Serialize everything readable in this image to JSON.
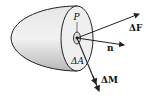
{
  "diagram": {
    "type": "free-body section",
    "labels": {
      "point": "P",
      "force": "ΔF",
      "normal": "n",
      "area": "ΔA",
      "moment": "ΔM"
    },
    "colors": {
      "body_fill": "#d9d9d9",
      "face_fill": "#eeeeee",
      "stroke": "#222222"
    }
  }
}
